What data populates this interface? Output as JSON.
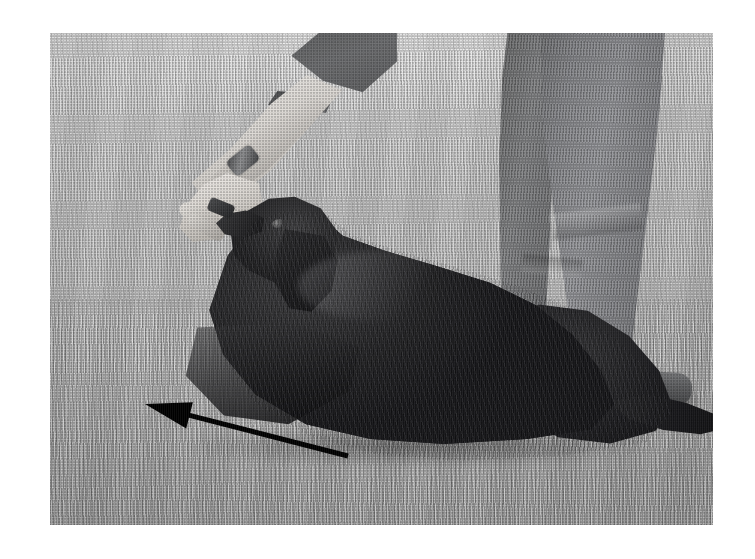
{
  "page": {
    "background_color": "#ffffff",
    "width": 755,
    "height": 559
  },
  "photograph": {
    "name": "dog-training-photo",
    "medium": "black-and-white halftone print",
    "alt": "A black long-haired dog lies in a down position on a mown lawn while a trainer's hand offers a treat at its nose; a second person's trousered legs and shoe stand behind, and a printed black arrow points up and to the left.",
    "frame": {
      "left": 50,
      "top": 33,
      "width": 663,
      "height": 492
    },
    "tones": {
      "grass_highlight": "#ececec",
      "grass_midtone": "#c7c7c7",
      "grass_shadow": "#b2b2b2",
      "trouser_grey": "#85868a",
      "skin_light": "#f4f2ef",
      "dog_black": "#17171a",
      "annotation_black": "#000000"
    },
    "subjects": [
      {
        "name": "trainer-arm",
        "label": "Trainer's forearm and hand with treat"
      },
      {
        "name": "trainer-watch",
        "label": "Wristwatch"
      },
      {
        "name": "dog",
        "label": "Black long-haired dog in down position"
      },
      {
        "name": "handler-legs",
        "label": "Second person's trousered legs and shoe"
      },
      {
        "name": "lawn",
        "label": "Mown grass lawn"
      }
    ],
    "annotation": {
      "name": "direction-arrow",
      "type": "arrow",
      "label": "Movement direction arrow",
      "color": "#000000",
      "direction": "up-left",
      "tail": {
        "x": 348,
        "y": 456
      },
      "tip": {
        "x": 145,
        "y": 404
      },
      "shaft_width": 5,
      "head_length": 46,
      "head_width": 27
    }
  }
}
